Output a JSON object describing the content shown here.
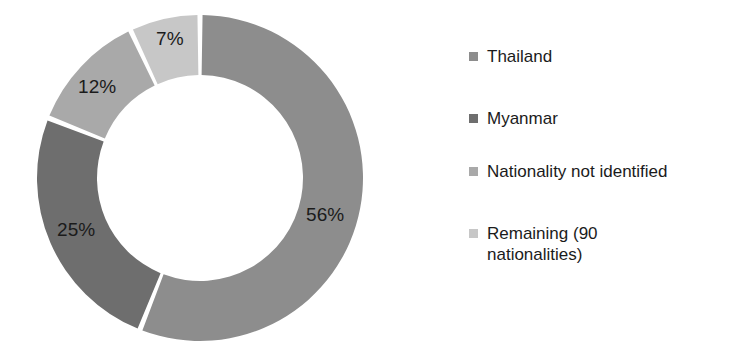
{
  "chart_data": {
    "type": "pie",
    "variant": "donut",
    "title": "",
    "subtitle": "",
    "xlabel": "",
    "ylabel": "",
    "grid": false,
    "legend_position": "right",
    "start_angle_deg": 0,
    "direction": "clockwise",
    "categories": [
      "Thailand",
      "Myanmar",
      "Nationality not identified",
      "Remaining (90 nationalities)"
    ],
    "values": [
      56,
      25,
      12,
      7
    ],
    "value_unit": "%",
    "data_labels": [
      "56%",
      "25%",
      "12%",
      "7%"
    ],
    "colors": [
      "#8d8d8d",
      "#6e6e6e",
      "#a9a9a9",
      "#c7c7c7"
    ],
    "slice_gap_color": "#ffffff"
  },
  "donut": {
    "slices": [
      {
        "label": "Thailand",
        "value": 56,
        "data_label": "56%",
        "color": "#8d8d8d"
      },
      {
        "label": "Myanmar",
        "value": 25,
        "data_label": "25%",
        "color": "#6e6e6e"
      },
      {
        "label": "Nationality not identified",
        "value": 12,
        "data_label": "12%",
        "color": "#a9a9a9"
      },
      {
        "label": "Remaining (90 nationalities)",
        "value": 7,
        "data_label": "7%",
        "color": "#c7c7c7"
      }
    ]
  },
  "legend": {
    "items": [
      {
        "label": "Thailand",
        "color": "#8d8d8d"
      },
      {
        "label": "Myanmar",
        "color": "#6e6e6e"
      },
      {
        "label": "Nationality not identified",
        "color": "#a9a9a9"
      },
      {
        "label": "Remaining (90 nationalities)",
        "color": "#c7c7c7"
      }
    ]
  },
  "theme": {
    "background": "#ffffff",
    "text_color": "#1b1b1b"
  }
}
